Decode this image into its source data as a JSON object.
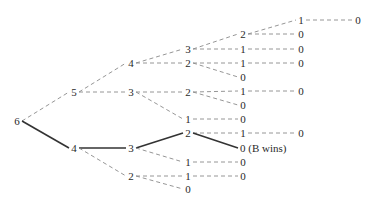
{
  "diagram": {
    "type": "game-tree",
    "colors": {
      "dashed_edge": "#8a8a8a",
      "solid_edge": "#333333",
      "text": "#2a2a2a"
    },
    "nodes": [
      {
        "id": "n6",
        "label": "6",
        "x": 17,
        "y": 121
      },
      {
        "id": "n5",
        "label": "5",
        "x": 74,
        "y": 92
      },
      {
        "id": "n4b",
        "label": "4",
        "x": 74,
        "y": 148
      },
      {
        "id": "a4",
        "label": "4",
        "x": 131,
        "y": 63
      },
      {
        "id": "a3",
        "label": "3",
        "x": 131,
        "y": 92
      },
      {
        "id": "b3",
        "label": "3",
        "x": 131,
        "y": 148
      },
      {
        "id": "b2",
        "label": "2",
        "x": 131,
        "y": 176
      },
      {
        "id": "c3",
        "label": "3",
        "x": 188,
        "y": 49
      },
      {
        "id": "c2",
        "label": "2",
        "x": 188,
        "y": 63
      },
      {
        "id": "c2b",
        "label": "2",
        "x": 188,
        "y": 92
      },
      {
        "id": "c1",
        "label": "1",
        "x": 188,
        "y": 119
      },
      {
        "id": "d2",
        "label": "2",
        "x": 188,
        "y": 133
      },
      {
        "id": "d1",
        "label": "1",
        "x": 188,
        "y": 162
      },
      {
        "id": "d1b",
        "label": "1",
        "x": 188,
        "y": 176
      },
      {
        "id": "d0",
        "label": "0",
        "x": 188,
        "y": 189
      },
      {
        "id": "e2",
        "label": "2",
        "x": 243,
        "y": 34
      },
      {
        "id": "e1",
        "label": "1",
        "x": 243,
        "y": 49
      },
      {
        "id": "e1b",
        "label": "1",
        "x": 243,
        "y": 63
      },
      {
        "id": "e0",
        "label": "0",
        "x": 243,
        "y": 77
      },
      {
        "id": "e1c",
        "label": "1",
        "x": 243,
        "y": 91
      },
      {
        "id": "e0b",
        "label": "0",
        "x": 243,
        "y": 105
      },
      {
        "id": "e0c",
        "label": "0",
        "x": 243,
        "y": 119
      },
      {
        "id": "e1d",
        "label": "1",
        "x": 243,
        "y": 133
      },
      {
        "id": "e0w",
        "label": "0 (B wins)",
        "x": 243,
        "y": 148,
        "note": true
      },
      {
        "id": "e0d",
        "label": "0",
        "x": 243,
        "y": 162
      },
      {
        "id": "e0e",
        "label": "0",
        "x": 243,
        "y": 176
      },
      {
        "id": "f1",
        "label": "1",
        "x": 301,
        "y": 20
      },
      {
        "id": "f0",
        "label": "0",
        "x": 301,
        "y": 34
      },
      {
        "id": "f0b",
        "label": "0",
        "x": 301,
        "y": 49
      },
      {
        "id": "f0c",
        "label": "0",
        "x": 301,
        "y": 63
      },
      {
        "id": "f0d",
        "label": "0",
        "x": 301,
        "y": 91
      },
      {
        "id": "f0e",
        "label": "0",
        "x": 301,
        "y": 133
      },
      {
        "id": "g0",
        "label": "0",
        "x": 358,
        "y": 20
      }
    ],
    "edges": [
      {
        "from": "n6",
        "to": "n5",
        "style": "dashed"
      },
      {
        "from": "n6",
        "to": "n4b",
        "style": "solid"
      },
      {
        "from": "n5",
        "to": "a4",
        "style": "dashed"
      },
      {
        "from": "n5",
        "to": "a3",
        "style": "dashed"
      },
      {
        "from": "n4b",
        "to": "b3",
        "style": "solid"
      },
      {
        "from": "n4b",
        "to": "b2",
        "style": "dashed"
      },
      {
        "from": "a4",
        "to": "c3",
        "style": "dashed"
      },
      {
        "from": "a4",
        "to": "c2",
        "style": "dashed"
      },
      {
        "from": "a3",
        "to": "c2b",
        "style": "dashed"
      },
      {
        "from": "a3",
        "to": "c1",
        "style": "dashed"
      },
      {
        "from": "b3",
        "to": "d2",
        "style": "solid"
      },
      {
        "from": "b3",
        "to": "d1",
        "style": "dashed"
      },
      {
        "from": "b2",
        "to": "d1b",
        "style": "dashed"
      },
      {
        "from": "b2",
        "to": "d0",
        "style": "dashed"
      },
      {
        "from": "c3",
        "to": "e2",
        "style": "dashed"
      },
      {
        "from": "c3",
        "to": "e1",
        "style": "dashed"
      },
      {
        "from": "c2",
        "to": "e1b",
        "style": "dashed"
      },
      {
        "from": "c2",
        "to": "e0",
        "style": "dashed"
      },
      {
        "from": "c2b",
        "to": "e1c",
        "style": "dashed"
      },
      {
        "from": "c2b",
        "to": "e0b",
        "style": "dashed"
      },
      {
        "from": "c1",
        "to": "e0c",
        "style": "dashed"
      },
      {
        "from": "d2",
        "to": "e1d",
        "style": "dashed"
      },
      {
        "from": "d2",
        "to": "e0w",
        "style": "solid"
      },
      {
        "from": "d1",
        "to": "e0d",
        "style": "dashed"
      },
      {
        "from": "d1b",
        "to": "e0e",
        "style": "dashed"
      },
      {
        "from": "e2",
        "to": "f1",
        "style": "dashed"
      },
      {
        "from": "e2",
        "to": "f0",
        "style": "dashed"
      },
      {
        "from": "e1",
        "to": "f0b",
        "style": "dashed"
      },
      {
        "from": "e1b",
        "to": "f0c",
        "style": "dashed"
      },
      {
        "from": "e1c",
        "to": "f0d",
        "style": "dashed"
      },
      {
        "from": "e1d",
        "to": "f0e",
        "style": "dashed"
      },
      {
        "from": "f1",
        "to": "g0",
        "style": "dashed"
      }
    ]
  }
}
